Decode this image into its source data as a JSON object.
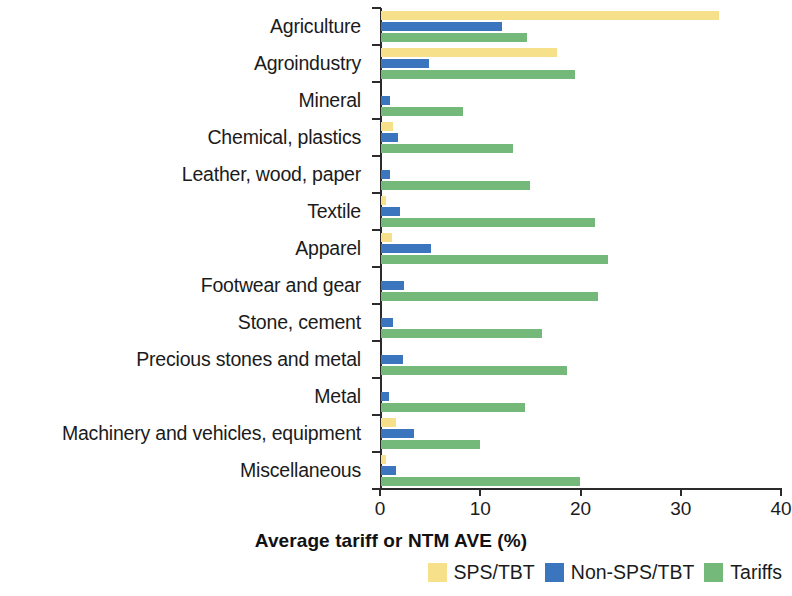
{
  "chart_data": {
    "type": "bar",
    "orientation": "horizontal",
    "title": "",
    "xlabel": "Average tariff or NTM AVE (%)",
    "ylabel": "",
    "xlim": [
      0,
      40
    ],
    "xticks": [
      0,
      10,
      20,
      30,
      40
    ],
    "xtick_labels": [
      "0",
      "10",
      "20",
      "30",
      "40"
    ],
    "grid": false,
    "legend_position": "bottom-right",
    "categories": [
      "Agriculture",
      "Agroindustry",
      "Mineral",
      "Chemical, plastics",
      "Leather, wood, paper",
      "Textile",
      "Apparel",
      "Footwear and gear",
      "Stone, cement",
      "Precious stones and metal",
      "Metal",
      "Machinery and vehicles, equipment",
      "Miscellaneous"
    ],
    "series": [
      {
        "name": "SPS/TBT",
        "color": "#f7e08a",
        "values": [
          33.7,
          17.6,
          0.0,
          1.2,
          0.0,
          0.5,
          1.1,
          0.0,
          0.0,
          0.0,
          0.0,
          1.5,
          0.5
        ]
      },
      {
        "name": "Non-SPS/TBT",
        "color": "#3a75be",
        "values": [
          12.1,
          4.8,
          0.9,
          1.7,
          0.9,
          1.9,
          5.0,
          2.3,
          1.2,
          2.2,
          0.8,
          3.3,
          1.5
        ]
      },
      {
        "name": "Tariffs",
        "color": "#74b87a",
        "values": [
          14.6,
          19.4,
          8.2,
          13.2,
          14.9,
          21.3,
          22.6,
          21.6,
          16.1,
          18.6,
          14.4,
          9.9,
          19.9
        ]
      }
    ]
  },
  "legend": {
    "items": [
      {
        "label": "SPS/TBT",
        "swatch": "sps"
      },
      {
        "label": "Non-SPS/TBT",
        "swatch": "nonsps"
      },
      {
        "label": "Tariffs",
        "swatch": "tariff"
      }
    ]
  },
  "colors": {
    "sps": "#f7e08a",
    "nonsps": "#3a75be",
    "tariff": "#74b87a",
    "axis": "#2b2b2b",
    "text": "#1b1b1b",
    "background": "#ffffff"
  }
}
